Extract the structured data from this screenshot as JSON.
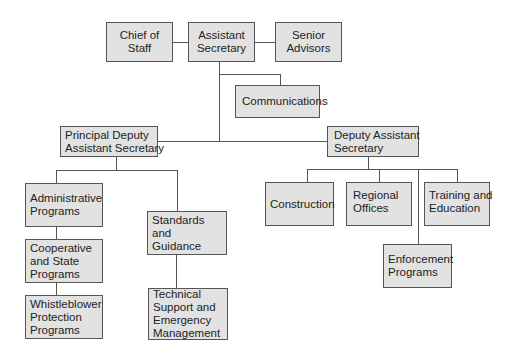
{
  "diagram": {
    "type": "org-chart",
    "nodes": {
      "chief_of_staff": {
        "lines": [
          "Chief of",
          "Staff"
        ]
      },
      "assistant_secretary": {
        "lines": [
          "Assistant",
          "Secretary"
        ]
      },
      "senior_advisors": {
        "lines": [
          "Senior",
          "Advisors"
        ]
      },
      "communications": {
        "lines": [
          "Communications"
        ]
      },
      "principal_deputy": {
        "lines": [
          "Principal Deputy",
          "Assistant Secretary"
        ]
      },
      "deputy_assistant": {
        "lines": [
          "Deputy Assistant",
          "Secretary"
        ]
      },
      "administrative_programs": {
        "lines": [
          "Administrative",
          "Programs"
        ]
      },
      "cooperative_state": {
        "lines": [
          "Cooperative",
          "and State",
          "Programs"
        ]
      },
      "whistleblower": {
        "lines": [
          "Whistleblower",
          "Protection",
          "Programs"
        ]
      },
      "standards_guidance": {
        "lines": [
          "Standards",
          "and",
          "Guidance"
        ]
      },
      "technical_support": {
        "lines": [
          "Technical",
          "Support and",
          "Emergency",
          "Management"
        ]
      },
      "construction": {
        "lines": [
          "Construction"
        ]
      },
      "regional_offices": {
        "lines": [
          "Regional",
          "Offices"
        ]
      },
      "training_education": {
        "lines": [
          "Training and",
          "Education"
        ]
      },
      "enforcement_programs": {
        "lines": [
          "Enforcement",
          "Programs"
        ]
      }
    },
    "edges": [
      [
        "assistant_secretary",
        "chief_of_staff"
      ],
      [
        "assistant_secretary",
        "senior_advisors"
      ],
      [
        "assistant_secretary",
        "communications"
      ],
      [
        "assistant_secretary",
        "principal_deputy"
      ],
      [
        "assistant_secretary",
        "deputy_assistant"
      ],
      [
        "principal_deputy",
        "administrative_programs"
      ],
      [
        "administrative_programs",
        "cooperative_state"
      ],
      [
        "cooperative_state",
        "whistleblower"
      ],
      [
        "principal_deputy",
        "standards_guidance"
      ],
      [
        "standards_guidance",
        "technical_support"
      ],
      [
        "deputy_assistant",
        "construction"
      ],
      [
        "deputy_assistant",
        "regional_offices"
      ],
      [
        "deputy_assistant",
        "training_education"
      ],
      [
        "deputy_assistant",
        "enforcement_programs"
      ]
    ],
    "colors": {
      "box_fill": "#e2e2e2",
      "box_border": "#555555",
      "line": "#555555",
      "text": "#222222"
    }
  }
}
